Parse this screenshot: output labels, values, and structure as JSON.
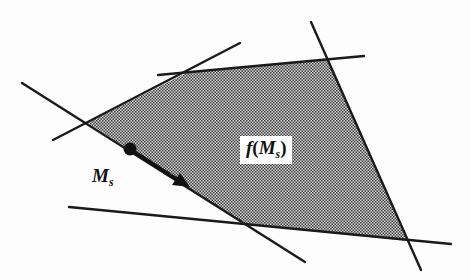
{
  "diagram": {
    "region_label": {
      "func": "f",
      "open": "(",
      "var": "M",
      "sub": "s",
      "close": ")"
    },
    "point_label": {
      "var": "M",
      "sub": "s"
    },
    "colors": {
      "line": "#1a1a1a",
      "fill_dark": "#3a3a3a",
      "fill_light": "#d8d8d8",
      "background": "#fdfdfd"
    },
    "polygon_vertices": [
      [
        88,
        123
      ],
      [
        188,
        72
      ],
      [
        327,
        59
      ],
      [
        407,
        241
      ],
      [
        245,
        224
      ]
    ],
    "lines": [
      {
        "name": "upper-left-constraint",
        "from": [
          53,
          140
        ],
        "to": [
          240,
          43
        ]
      },
      {
        "name": "top-constraint",
        "from": [
          158,
          75
        ],
        "to": [
          364,
          56
        ]
      },
      {
        "name": "right-constraint",
        "from": [
          311,
          22
        ],
        "to": [
          421,
          270
        ]
      },
      {
        "name": "bottom-constraint",
        "from": [
          69,
          207
        ],
        "to": [
          451,
          244
        ]
      },
      {
        "name": "lower-left-constraint",
        "from": [
          22,
          83
        ],
        "to": [
          305,
          262
        ]
      }
    ],
    "point": [
      130,
      149
    ],
    "arrow_tip": [
      188,
      186
    ]
  }
}
